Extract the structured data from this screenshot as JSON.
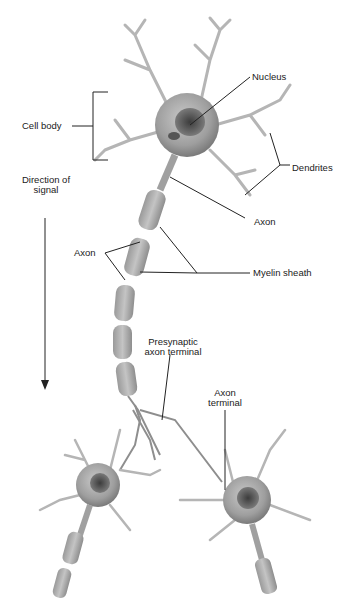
{
  "diagram": {
    "labels": {
      "nucleus": "Nucleus",
      "cell_body": "Cell body",
      "dendrites": "Dendrites",
      "axon_upper": "Axon",
      "direction_line1": "Direction of",
      "direction_line2": "signal",
      "axon_left": "Axon",
      "myelin_sheath": "Myelin sheath",
      "presynaptic_line1": "Presynaptic",
      "presynaptic_line2": "axon terminal",
      "axon_terminal_line1": "Axon",
      "axon_terminal_line2": "terminal"
    },
    "colors": {
      "cell": "#a8a8a8",
      "cell_dark": "#6e6e6e",
      "nucleus": "#4a4a4a",
      "line": "#222222",
      "background": "#ffffff"
    }
  }
}
